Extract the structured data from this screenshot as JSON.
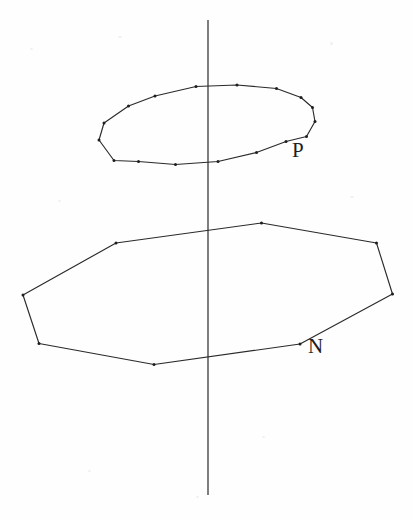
{
  "figure": {
    "background_color": "#fefefe",
    "stroke_color": "#2a2a2a",
    "label_color": "#1d1d1d",
    "width": 414,
    "height": 520,
    "labels": {
      "upper_polygon": "P",
      "lower_polygon": "N"
    },
    "axis": {
      "name": "vertical-axis",
      "x": 208,
      "y_top": 20,
      "y_bottom": 495
    },
    "upper_polygon": {
      "name": "P",
      "vertex_count": 16,
      "closed": true,
      "points": [
        [
          128.5,
          106.0
        ],
        [
          155.0,
          96.0
        ],
        [
          196.0,
          86.5
        ],
        [
          237.0,
          85.0
        ],
        [
          276.5,
          88.5
        ],
        [
          301.0,
          97.5
        ],
        [
          312.5,
          107.5
        ],
        [
          315.0,
          121.5
        ],
        [
          306.5,
          136.5
        ],
        [
          286.0,
          141.5
        ],
        [
          256.5,
          152.5
        ],
        [
          218.0,
          161.5
        ],
        [
          175.5,
          164.5
        ],
        [
          138.5,
          161.5
        ],
        [
          114.0,
          160.5
        ],
        [
          99.0,
          140.0
        ],
        [
          104.0,
          123.0
        ]
      ]
    },
    "lower_polygon": {
      "name": "N",
      "vertex_count": 8,
      "closed": true,
      "points": [
        [
          261.5,
          223.0
        ],
        [
          376.5,
          243.0
        ],
        [
          392.5,
          294.0
        ],
        [
          300.0,
          344.0
        ],
        [
          154.0,
          364.5
        ],
        [
          39.0,
          343.5
        ],
        [
          23.0,
          295.0
        ],
        [
          116.0,
          243.0
        ]
      ]
    }
  }
}
